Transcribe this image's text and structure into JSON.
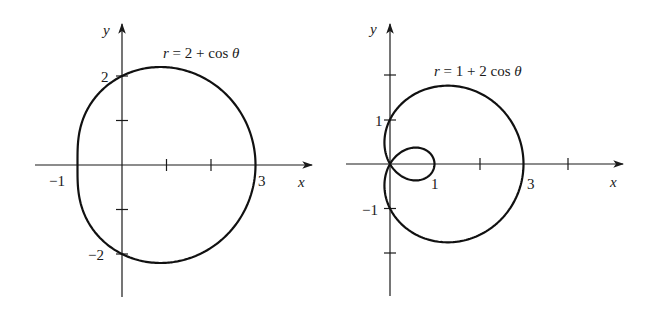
{
  "chart_data": [
    {
      "type": "line",
      "subtype": "polar",
      "title": "r = 2 + cos θ",
      "equation": {
        "a": 2,
        "b": 1
      },
      "xlabel": "x",
      "ylabel": "y",
      "x_tick_labels": [
        {
          "value": -1,
          "text": "−1"
        },
        {
          "value": 3,
          "text": "3"
        }
      ],
      "y_tick_labels": [
        {
          "value": 2,
          "text": "2"
        },
        {
          "value": -2,
          "text": "−2"
        }
      ],
      "x_ticks": [
        1,
        2
      ],
      "y_ticks": [
        1,
        -1
      ],
      "xlim": [
        -1.95,
        4.4
      ],
      "ylim": [
        -3.0,
        3.15
      ],
      "grid": false,
      "legend": null,
      "key_points": [
        {
          "x": 3,
          "y": 0
        },
        {
          "x": -1,
          "y": 0
        },
        {
          "x": 0,
          "y": 2
        },
        {
          "x": 0,
          "y": -2
        }
      ]
    },
    {
      "type": "line",
      "subtype": "polar",
      "title": "r = 1 + 2 cos θ",
      "equation": {
        "a": 1,
        "b": 2
      },
      "xlabel": "x",
      "ylabel": "y",
      "x_tick_labels": [
        {
          "value": 1,
          "text": "1"
        },
        {
          "value": 3,
          "text": "3"
        }
      ],
      "y_tick_labels": [
        {
          "value": 1,
          "text": "1"
        },
        {
          "value": -1,
          "text": "−1"
        }
      ],
      "x_ticks": [
        2,
        4
      ],
      "y_ticks": [
        2,
        -2
      ],
      "xlim": [
        -0.7,
        5.2
      ],
      "ylim": [
        -3.0,
        3.15
      ],
      "grid": false,
      "legend": null,
      "key_points": [
        {
          "x": 3,
          "y": 0
        },
        {
          "x": 1,
          "y": 0
        },
        {
          "x": 0,
          "y": 1
        },
        {
          "x": 0,
          "y": -1
        },
        {
          "x": 0,
          "y": 0
        }
      ]
    }
  ],
  "plots": {
    "left": {
      "equation_parts": {
        "lhs": "r",
        "rhs": " = 2 + cos ",
        "theta": "θ"
      },
      "x_axis_label": "x",
      "y_axis_label": "y",
      "labels": {
        "xneg1": "−1",
        "x3": "3",
        "y2": "2",
        "yneg2": "−2"
      }
    },
    "right": {
      "equation_parts": {
        "lhs": "r",
        "rhs": " = 1 + 2 cos ",
        "theta": "θ"
      },
      "x_axis_label": "x",
      "y_axis_label": "y",
      "labels": {
        "x1": "1",
        "x3": "3",
        "y1": "1",
        "yneg1": "−1"
      }
    }
  },
  "layout": {
    "unit_px": 44.5,
    "left_origin": [
      122,
      165
    ],
    "right_origin": [
      390,
      164
    ]
  }
}
